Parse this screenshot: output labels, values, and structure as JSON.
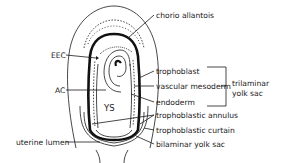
{
  "figure": {
    "labels": {
      "chorio_allantois": "chorio allantois",
      "eec": "EEC",
      "ac": "AC",
      "ys": "YS",
      "uterine_lumen": "uterine lumen",
      "trophoblast": "trophoblast",
      "vascular_mesoderm": "vascular mesoderm",
      "endoderm": "endoderm",
      "trophoblastic_annulus": "trophoblastic annulus",
      "trophoblastic_curtain": "trophoblastic curtain",
      "bilaminar_yolk_sac": "bilaminar yolk sac",
      "trilaminar_line1": "trilaminar",
      "trilaminar_line2": "yolk sac"
    },
    "colors": {
      "ink": "#1a1a1a",
      "background": "#ffffff"
    }
  }
}
